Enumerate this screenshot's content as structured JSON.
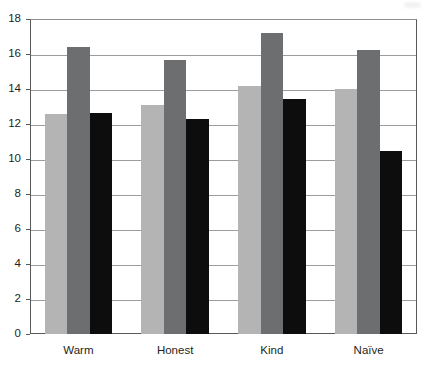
{
  "chart_data": {
    "type": "bar",
    "title": "",
    "subtitle": "",
    "xlabel": "",
    "ylabel": "",
    "categories": [
      "Warm",
      "Honest",
      "Kind",
      "Naïve"
    ],
    "series": [
      {
        "name": "series-1",
        "color": "#b4b4b4",
        "values": [
          12.6,
          13.1,
          14.2,
          14.0
        ]
      },
      {
        "name": "series-2",
        "color": "#6d6e70",
        "values": [
          16.4,
          15.65,
          17.2,
          16.25
        ]
      },
      {
        "name": "series-3",
        "color": "#0d0d0d",
        "values": [
          12.65,
          12.3,
          13.45,
          10.45
        ]
      }
    ],
    "ylim": [
      0,
      18
    ],
    "ytick_step": 2,
    "yticks": [
      "0",
      "2",
      "4",
      "6",
      "8",
      "10",
      "12",
      "14",
      "16",
      "18"
    ],
    "grid": true,
    "grid_axis": "y",
    "legend": "none",
    "legend_position": "none",
    "annotations": []
  },
  "axis": {
    "axis_color": "#58595b",
    "grid_color": "#9a9c9e",
    "background": "#ffffff"
  }
}
